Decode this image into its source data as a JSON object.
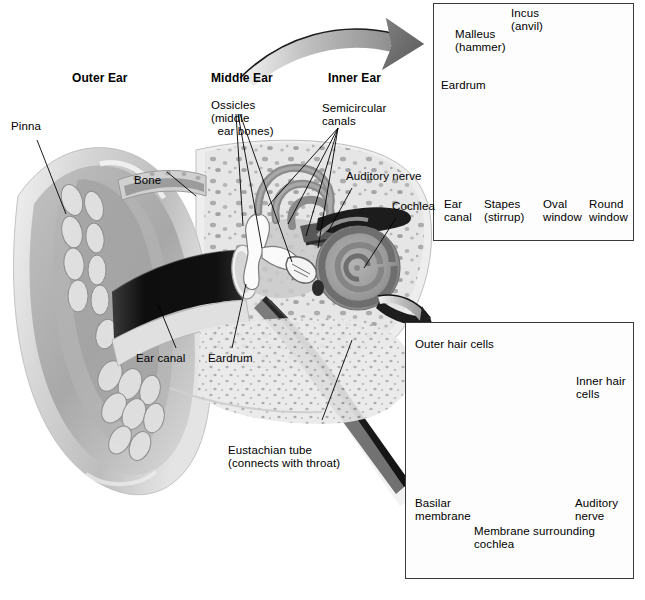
{
  "figure": {
    "type": "anatomical-diagram",
    "background_color": "#ffffff"
  },
  "main_diagram": {
    "section_headings": [
      {
        "id": "outer",
        "label": "Outer Ear"
      },
      {
        "id": "middle",
        "label": "Middle Ear"
      },
      {
        "id": "inner",
        "label": "Inner Ear"
      }
    ],
    "labels": [
      {
        "id": "pinna",
        "label": "Pinna"
      },
      {
        "id": "bone",
        "label": "Bone"
      },
      {
        "id": "ossicles",
        "label": "Ossicles\n(middle\n  ear bones)"
      },
      {
        "id": "semicircular-canals",
        "label": "Semicircular\ncanals"
      },
      {
        "id": "auditory-nerve",
        "label": "Auditory nerve"
      },
      {
        "id": "cochlea",
        "label": "Cochlea"
      },
      {
        "id": "ear-canal",
        "label": "Ear canal"
      },
      {
        "id": "eardrum",
        "label": "Eardrum"
      },
      {
        "id": "eustachian-tube",
        "label": "Eustachian tube\n(connects with throat)"
      }
    ]
  },
  "inset_middle_ear": {
    "caption": "Middle ear ossicles detail",
    "labels": [
      {
        "id": "malleus",
        "label": "Malleus\n(hammer)"
      },
      {
        "id": "incus",
        "label": "Incus\n(anvil)"
      },
      {
        "id": "eardrum",
        "label": "Eardrum"
      },
      {
        "id": "ear-canal",
        "label": "Ear\ncanal"
      },
      {
        "id": "stapes",
        "label": "Stapes\n(stirrup)"
      },
      {
        "id": "oval-window",
        "label": "Oval\nwindow"
      },
      {
        "id": "round-window",
        "label": "Round\nwindow"
      }
    ]
  },
  "inset_cochlea": {
    "caption": "Cochlea cross-section detail",
    "labels": [
      {
        "id": "outer-hair-cells",
        "label": "Outer hair cells"
      },
      {
        "id": "inner-hair-cells",
        "label": "Inner hair\ncells"
      },
      {
        "id": "basilar-membrane",
        "label": "Basilar\nmembrane"
      },
      {
        "id": "membrane-surrounding-cochlea",
        "label": "Membrane surrounding\ncochlea"
      },
      {
        "id": "auditory-nerve",
        "label": "Auditory\nnerve"
      }
    ]
  },
  "colors": {
    "ink": "#000000",
    "panel_border": "#3a3a3a",
    "tissue_light": "#dcdcdc",
    "tissue_mid": "#9a9a9a",
    "tissue_dark": "#6b6b6b",
    "canal_dark": "#151515",
    "bone_white": "#f6f6f6"
  }
}
